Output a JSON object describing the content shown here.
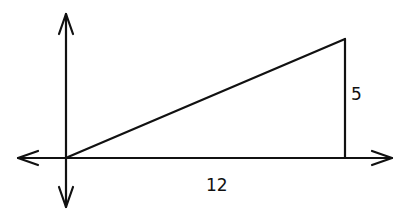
{
  "diagram": {
    "type": "right-triangle-on-axes",
    "labels": {
      "height": "5",
      "base": "12"
    },
    "vertices": [
      [
        0,
        0
      ],
      [
        12,
        5
      ],
      [
        12,
        0
      ]
    ],
    "stroke_color": "#111111",
    "background": "#ffffff"
  }
}
